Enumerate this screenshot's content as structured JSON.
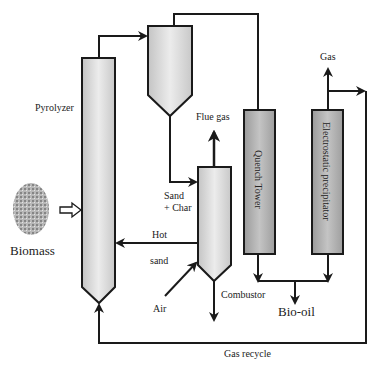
{
  "diagram": {
    "type": "process-flow",
    "title": "",
    "colors": {
      "line": "#1a1a1a",
      "vessel_light": "#dedede",
      "vessel_dark": "#a8a8a8",
      "background": "#ffffff"
    },
    "units": {
      "pyrolyzer": {
        "label": "Pyrolyzer"
      },
      "cyclone": {
        "label": ""
      },
      "combustor": {
        "label": "Combustor"
      },
      "quench_tower": {
        "label": "Quench Tower"
      },
      "esp": {
        "label": "Electrostatic precipitator"
      }
    },
    "streams": {
      "biomass": "Biomass",
      "flue_gas": "Flue gas",
      "sand_char_1": "Sand",
      "sand_char_2": "+ Char",
      "hot_sand_1": "Hot",
      "hot_sand_2": "sand",
      "air": "Air",
      "gas": "Gas",
      "bio_oil": "Bio-oil",
      "gas_recycle": "Gas recycle"
    }
  }
}
